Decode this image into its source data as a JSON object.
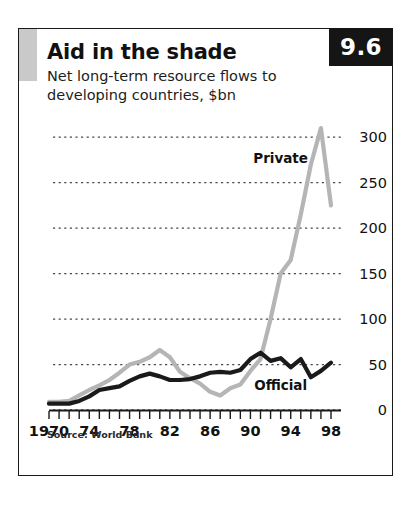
{
  "card": {
    "badge": "9.6",
    "title": "Aid in the shade",
    "subtitle": "Net long-term resource flows to developing countries, $bn",
    "source": "Source: World Bank"
  },
  "chart_data": {
    "type": "line",
    "title": "Aid in the shade",
    "subtitle": "Net long-term resource flows to developing countries, $bn",
    "xlabel": "",
    "ylabel": "$bn",
    "ylim": [
      0,
      320
    ],
    "xlim": [
      1970,
      1998
    ],
    "yticks": [
      0,
      50,
      100,
      150,
      200,
      250,
      300
    ],
    "ytick_labels": [
      "0",
      "50",
      "100",
      "150",
      "200",
      "250",
      "300"
    ],
    "xticks": [
      1970,
      1971,
      1972,
      1973,
      1974,
      1975,
      1976,
      1977,
      1978,
      1979,
      1980,
      1981,
      1982,
      1983,
      1984,
      1985,
      1986,
      1987,
      1988,
      1989,
      1990,
      1991,
      1992,
      1993,
      1994,
      1995,
      1996,
      1997,
      1998
    ],
    "xtick_labels": [
      "1970",
      "74",
      "78",
      "82",
      "86",
      "90",
      "94",
      "98"
    ],
    "xtick_label_years": [
      1970,
      1974,
      1978,
      1982,
      1986,
      1990,
      1994,
      1998
    ],
    "grid": true,
    "grid_style": "dotted-horizontal",
    "legend": "inline-annotations",
    "x": [
      1970,
      1971,
      1972,
      1973,
      1974,
      1975,
      1976,
      1977,
      1978,
      1979,
      1980,
      1981,
      1982,
      1983,
      1984,
      1985,
      1986,
      1987,
      1988,
      1989,
      1990,
      1991,
      1992,
      1993,
      1994,
      1995,
      1996,
      1997,
      1998
    ],
    "series": [
      {
        "name": "Private",
        "color": "#b5b5b5",
        "label": "Private",
        "values": [
          9,
          9,
          10,
          16,
          22,
          27,
          33,
          41,
          50,
          53,
          58,
          66,
          58,
          42,
          35,
          29,
          20,
          16,
          24,
          28,
          43,
          56,
          100,
          150,
          165,
          215,
          270,
          310,
          225
        ]
      },
      {
        "name": "Official",
        "color": "#1a1a1a",
        "label": "Official",
        "values": [
          7,
          7,
          7,
          10,
          15,
          22,
          24,
          26,
          32,
          37,
          40,
          37,
          33,
          33,
          34,
          37,
          41,
          42,
          41,
          44,
          56,
          63,
          54,
          57,
          47,
          56,
          36,
          43,
          52
        ]
      }
    ],
    "annotations": [
      {
        "text": "Private",
        "x": 1993,
        "y": 272
      },
      {
        "text": "Official",
        "x": 1993,
        "y": 22
      }
    ]
  }
}
